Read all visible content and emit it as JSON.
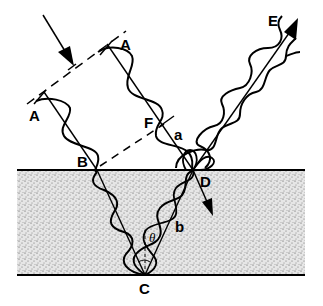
{
  "diagram": {
    "colors": {
      "ink": "#000000",
      "film": "#d9d9d9",
      "background": "#ffffff"
    },
    "labels": {
      "A_left": "A",
      "A_right": "A",
      "B": "B",
      "C": "C",
      "D": "D",
      "E": "E",
      "F": "F",
      "a": "a",
      "b": "b",
      "theta": "θ"
    },
    "elements": [
      "incident-arrow",
      "wavefront-dashed-line-AA",
      "ray-A-B-C",
      "ray-A-F-D",
      "dashed-line-B-F",
      "film-layer",
      "ray-C-D-internal-reflection",
      "reflected-ray-D-E",
      "refracted-arrow-at-D",
      "angle-theta-at-C"
    ]
  }
}
